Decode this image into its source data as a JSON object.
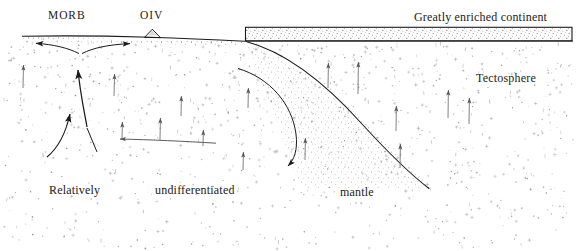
{
  "figure": {
    "title_alt": "Schematic cross-section of mantle convection, tectosphere and continental enrichment",
    "width": 576,
    "height": 251,
    "background_color": "#ffffff",
    "ink_color": "#1b1b1b",
    "stipple_color": "#8a8a8a"
  },
  "labels": {
    "morb": "MORB",
    "oiv": "OIV",
    "continent": "Greatly enriched continent",
    "tectosphere": "Tectosphere",
    "relatively": "Relatively",
    "undifferentiated": "undifferentiated",
    "mantle": "mantle"
  },
  "chart_data": {
    "type": "diagram",
    "annotations": [
      {
        "name": "MORB",
        "text": "MORB",
        "x": 69,
        "y": 16,
        "role": "spreading-ridge-label"
      },
      {
        "name": "OIV",
        "text": "OIV",
        "x": 154,
        "y": 16,
        "role": "ocean-island-volcano-label"
      },
      {
        "name": "Greatly enriched continent",
        "text": "Greatly enriched continent",
        "x": 486,
        "y": 17,
        "role": "continent-label"
      },
      {
        "name": "Tectosphere",
        "text": "Tectosphere",
        "x": 510,
        "y": 78,
        "role": "region-label"
      },
      {
        "name": "Relatively",
        "text": "Relatively",
        "x": 77,
        "y": 190,
        "role": "region-label-part-1"
      },
      {
        "name": "undifferentiated",
        "text": "undifferentiated",
        "x": 195,
        "y": 190,
        "role": "region-label-part-2"
      },
      {
        "name": "mantle",
        "text": "mantle",
        "x": 357,
        "y": 192,
        "role": "region-label-part-3"
      }
    ],
    "features": [
      {
        "name": "seafloor",
        "type": "surface-line",
        "from": [
          22,
          36
        ],
        "to": [
          245,
          41
        ]
      },
      {
        "name": "oiv-volcano",
        "type": "triangle",
        "apex": [
          152,
          29
        ],
        "base": [
          144,
          37,
          161,
          37
        ]
      },
      {
        "name": "continent-block",
        "type": "rect",
        "x": 245,
        "y": 27,
        "width": 327,
        "height": 14,
        "fill": "stipple"
      },
      {
        "name": "subducting-slab",
        "type": "curve",
        "from": [
          246,
          41
        ],
        "to": [
          430,
          188
        ]
      },
      {
        "name": "return-flow-curve",
        "type": "curve",
        "from": [
          240,
          68
        ],
        "to": [
          297,
          166
        ]
      },
      {
        "name": "ridge-divergence-left",
        "type": "arrow",
        "from": [
          76,
          52
        ],
        "to": [
          33,
          43
        ]
      },
      {
        "name": "ridge-divergence-right",
        "type": "arrow",
        "from": [
          85,
          52
        ],
        "to": [
          132,
          43
        ]
      },
      {
        "name": "plume-ascent-main",
        "type": "arrow",
        "from": [
          83,
          125
        ],
        "to": [
          77,
          67
        ]
      },
      {
        "name": "plume-ascent-left",
        "type": "arrow",
        "from": [
          48,
          156
        ],
        "to": [
          70,
          111
        ]
      },
      {
        "name": "deep-return-flow",
        "type": "arrow",
        "from": [
          215,
          141
        ],
        "to": [
          117,
          139
        ]
      },
      {
        "name": "tectosphere-uplift-arrows",
        "type": "arrow-set",
        "count": 9,
        "direction": "up"
      }
    ],
    "legend": [],
    "grid": false
  }
}
